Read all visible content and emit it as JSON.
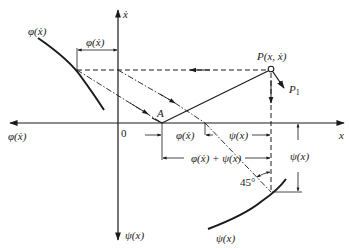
{
  "diagram": {
    "type": "phase-plane construction",
    "axes": {
      "horizontal_right_label": "x",
      "horizontal_left_label": "φ(ẋ)",
      "vertical_up_label": "ẋ",
      "vertical_down_label": "ψ(x)",
      "origin_label": "0"
    },
    "points": {
      "P_label": "P(x, ẋ)",
      "P1_label": "P",
      "P1_sub": "1",
      "A_label": "A"
    },
    "curves": {
      "phi_curve_label": "φ(ẋ)",
      "psi_curve_label": "ψ(x)"
    },
    "dimensions": {
      "phi_top": "φ(ẋ)",
      "phi_axis": "φ(ẋ)",
      "psi_axis": "ψ(x)",
      "sum": "φ(ẋ) + ψ(x)",
      "psi_vertical": "ψ(x)",
      "angle": "45°"
    },
    "colors": {
      "ink": "#1a1a1a",
      "background": "#ffffff"
    }
  }
}
